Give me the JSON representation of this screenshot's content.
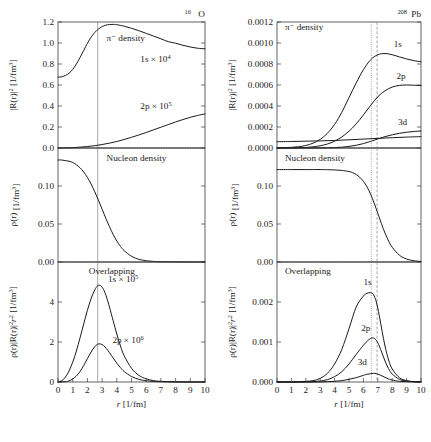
{
  "figure": {
    "caption_present": false,
    "x_axis": {
      "label": "r",
      "units": "[1/fm]",
      "min": 0,
      "max": 10,
      "ticks": [
        "0",
        "1",
        "2",
        "3",
        "4",
        "5",
        "6",
        "7",
        "8",
        "9",
        "10"
      ]
    }
  },
  "panels": {
    "left": {
      "title_main": "O",
      "title_sup": "16",
      "top": {
        "ylabel_main": "|R(r)|",
        "ylabel_sup": "2",
        "ylabel_units": "[1/fm",
        "ylabel_units_sup": "3",
        "ylabel_units_end": "]",
        "yticks": [
          "1.2",
          "1.0",
          "0.8",
          "0.6",
          "0.4",
          "0.2",
          "0.0"
        ],
        "ymin": 0.0,
        "ymax": 1.2,
        "annotation_density": "π⁻  density",
        "annotation_1s": "1s × 10",
        "annotation_1s_sup": "4",
        "annotation_2p": "2p × 10",
        "annotation_2p_sup": "5"
      },
      "middle": {
        "ylabel_main": "ρ(r)",
        "ylabel_units": "[1/fm",
        "ylabel_units_sup": "3",
        "ylabel_units_end": "]",
        "yticks": [
          "0.15",
          "0.10",
          "0.05",
          "0.00"
        ],
        "ymin": 0.0,
        "ymax": 0.19,
        "annotation": "Nucleon density"
      },
      "bottom": {
        "ylabel_main": "ρ(r)|R(r)|",
        "ylabel_sup": "2",
        "ylabel_r2": "r",
        "ylabel_r2_sup": "2",
        "ylabel_units": "[1/fm",
        "ylabel_units_sup": "3",
        "ylabel_units_end": "]",
        "yticks": [
          "6",
          "4",
          "2",
          "0"
        ],
        "ymin": 0.0,
        "ymax": 7.2,
        "annotation_overlap": "Overlapping",
        "annotation_1s": "1s × 10",
        "annotation_1s_sup": "5",
        "annotation_2p": "2p × 10",
        "annotation_2p_sup": "6"
      }
    },
    "right": {
      "title_main": "Pb",
      "title_sup": "208",
      "top": {
        "ylabel_main": "|R(r)|",
        "ylabel_sup": "2",
        "ylabel_units": "[1/fm",
        "ylabel_units_sup": "3",
        "ylabel_units_end": "]",
        "yticks": [
          "0.0012",
          "0.0010",
          "0.0008",
          "0.0006",
          "0.0004",
          "0.0002",
          "0.0000"
        ],
        "ymin": 0.0,
        "ymax": 0.0012,
        "annotation_density": "π⁻  density",
        "label_1s": "1s",
        "label_2p": "2p",
        "label_3d": "3d"
      },
      "middle": {
        "ylabel_main": "ρ(r)",
        "ylabel_units": "[1/fm",
        "ylabel_units_sup": "3",
        "ylabel_units_end": "]",
        "yticks": [
          "0.15",
          "0.10",
          "0.05",
          "0.00"
        ],
        "ymin": 0.0,
        "ymax": 0.185,
        "annotation": "Nucleon density"
      },
      "bottom": {
        "ylabel_main": "ρ(r)|R(r)|",
        "ylabel_sup": "2",
        "ylabel_r2": "r",
        "ylabel_r2_sup": "2",
        "ylabel_units": "[1/fm",
        "ylabel_units_sup": "3",
        "ylabel_units_end": "]",
        "yticks": [
          "0.003",
          "0.002",
          "0.001",
          "0.000"
        ],
        "ymin": 0.0,
        "ymax": 0.0036,
        "annotation_overlap": "Overlapping",
        "label_1s": "1s",
        "label_2p": "2p",
        "label_3d": "3d"
      }
    }
  },
  "chart_data": [
    {
      "id": "left-top",
      "type": "line",
      "title": "16O pi- density",
      "xlabel": "r [1/fm]",
      "ylabel": "|R(r)|^2 [1/fm^3]",
      "xlim": [
        0,
        10
      ],
      "ylim": [
        0.0,
        1.2
      ],
      "grid": false,
      "legend": "inline annotations",
      "vertical_reference_lines": [
        2.7
      ],
      "series": [
        {
          "name": "1s x 10^4",
          "x": [
            0,
            0.25,
            0.5,
            0.75,
            1.0,
            1.25,
            1.5,
            1.75,
            2.0,
            2.25,
            2.5,
            2.75,
            3.0,
            3.25,
            3.5,
            3.75,
            4.0,
            4.5,
            5.0,
            5.5,
            6.0,
            6.5,
            7.0,
            7.5,
            8.0,
            8.5,
            9.0,
            9.5,
            10.0
          ],
          "y": [
            0.675,
            0.678,
            0.69,
            0.712,
            0.748,
            0.8,
            0.862,
            0.93,
            0.997,
            1.055,
            1.1,
            1.133,
            1.156,
            1.17,
            1.176,
            1.177,
            1.174,
            1.16,
            1.14,
            1.117,
            1.092,
            1.066,
            1.04,
            1.013,
            0.998,
            0.978,
            0.962,
            0.95,
            0.945
          ]
        },
        {
          "name": "2p x 10^5",
          "x": [
            0,
            0.5,
            1.0,
            1.5,
            2.0,
            2.5,
            3.0,
            3.5,
            4.0,
            4.5,
            5.0,
            5.5,
            6.0,
            6.5,
            7.0,
            7.5,
            8.0,
            8.5,
            9.0,
            9.5,
            10.0
          ],
          "y": [
            0.0,
            0.001,
            0.003,
            0.008,
            0.014,
            0.022,
            0.033,
            0.046,
            0.062,
            0.081,
            0.102,
            0.124,
            0.148,
            0.173,
            0.198,
            0.223,
            0.248,
            0.271,
            0.292,
            0.31,
            0.325
          ]
        }
      ]
    },
    {
      "id": "left-middle",
      "type": "line",
      "title": "16O Nucleon density",
      "xlabel": "r [1/fm]",
      "ylabel": "rho(r) [1/fm^3]",
      "xlim": [
        0,
        10
      ],
      "ylim": [
        0.0,
        0.19
      ],
      "grid": false,
      "vertical_reference_lines": [
        2.7
      ],
      "series": [
        {
          "name": "nucleon density",
          "x": [
            0,
            0.25,
            0.5,
            0.75,
            1.0,
            1.25,
            1.5,
            1.75,
            2.0,
            2.25,
            2.5,
            2.75,
            3.0,
            3.25,
            3.5,
            3.75,
            4.0,
            4.25,
            4.5,
            5.0,
            5.5,
            6.0,
            6.5,
            7.0,
            8.0,
            9.0,
            10.0
          ],
          "y": [
            0.17,
            0.17,
            0.169,
            0.168,
            0.166,
            0.162,
            0.157,
            0.15,
            0.141,
            0.13,
            0.117,
            0.103,
            0.088,
            0.073,
            0.059,
            0.046,
            0.035,
            0.026,
            0.019,
            0.0095,
            0.0045,
            0.0021,
            0.001,
            0.0005,
            0.0001,
            3e-05,
            1e-05
          ]
        }
      ]
    },
    {
      "id": "left-bottom",
      "type": "line",
      "title": "16O Overlapping",
      "xlabel": "r [1/fm]",
      "ylabel": "rho(r)|R(r)|^2 r^2 [1/fm^3]",
      "xlim": [
        0,
        10
      ],
      "ylim": [
        0.0,
        7.2
      ],
      "grid": false,
      "vertical_reference_lines": [
        2.7
      ],
      "series": [
        {
          "name": "1s x 10^5",
          "x": [
            0,
            0.25,
            0.5,
            0.75,
            1.0,
            1.25,
            1.5,
            1.75,
            2.0,
            2.25,
            2.5,
            2.7,
            2.9,
            3.1,
            3.3,
            3.5,
            3.75,
            4.0,
            4.25,
            4.5,
            5.0,
            5.5,
            6.0,
            6.5,
            7.0,
            8.0,
            9.0,
            10.0
          ],
          "y": [
            0.0,
            0.07,
            0.29,
            0.66,
            1.19,
            1.86,
            2.65,
            3.49,
            4.3,
            5.0,
            5.52,
            5.78,
            5.78,
            5.55,
            5.1,
            4.5,
            3.68,
            2.88,
            2.16,
            1.58,
            0.82,
            0.4,
            0.19,
            0.085,
            0.04,
            0.008,
            0.002,
            0.0
          ]
        },
        {
          "name": "2p x 10^6",
          "x": [
            0,
            0.5,
            0.75,
            1.0,
            1.25,
            1.5,
            1.75,
            2.0,
            2.25,
            2.5,
            2.7,
            2.9,
            3.1,
            3.3,
            3.5,
            3.75,
            4.0,
            4.25,
            4.5,
            5.0,
            5.5,
            6.0,
            6.5,
            7.0,
            8.0,
            9.0,
            10.0
          ],
          "y": [
            0.0,
            0.02,
            0.07,
            0.18,
            0.36,
            0.63,
            0.99,
            1.4,
            1.8,
            2.12,
            2.27,
            2.28,
            2.19,
            2.0,
            1.76,
            1.44,
            1.13,
            0.86,
            0.63,
            0.33,
            0.16,
            0.075,
            0.035,
            0.016,
            0.003,
            0.001,
            0.0
          ]
        }
      ]
    },
    {
      "id": "right-top",
      "type": "line",
      "title": "208Pb pi- density",
      "xlabel": "r [1/fm]",
      "ylabel": "|R(r)|^2 [1/fm^3]",
      "xlim": [
        0,
        10
      ],
      "ylim": [
        0.0,
        0.0012
      ],
      "grid": false,
      "vertical_reference_lines": [
        6.55,
        6.95
      ],
      "series": [
        {
          "name": "1s",
          "x": [
            0,
            0.5,
            1.0,
            1.5,
            2.0,
            2.5,
            3.0,
            3.5,
            4.0,
            4.5,
            5.0,
            5.5,
            6.0,
            6.5,
            7.0,
            7.5,
            8.0,
            8.5,
            9.0,
            9.5,
            10.0
          ],
          "y": [
            2e-06,
            3e-06,
            6e-06,
            1.2e-05,
            2.4e-05,
            4.6e-05,
            8.2e-05,
            0.00014,
            0.000225,
            0.00034,
            0.00048,
            0.00062,
            0.000745,
            0.00084,
            0.000888,
            0.0009,
            0.000888,
            0.000868,
            0.000848,
            0.000832,
            0.000822
          ]
        },
        {
          "name": "2p",
          "x": [
            0,
            0.5,
            1.0,
            1.5,
            2.0,
            2.5,
            3.0,
            3.5,
            4.0,
            4.5,
            5.0,
            5.5,
            6.0,
            6.5,
            7.0,
            7.5,
            8.0,
            8.5,
            9.0,
            9.5,
            10.0
          ],
          "y": [
            0.0,
            0.0,
            1e-06,
            2e-06,
            5e-06,
            1.1e-05,
            2.1e-05,
            3.8e-05,
            6.5e-05,
            0.000105,
            0.00016,
            0.00023,
            0.000315,
            0.000405,
            0.000488,
            0.000545,
            0.00058,
            0.000596,
            0.0006,
            0.000598,
            0.000594
          ]
        },
        {
          "name": "3d",
          "x": [
            0,
            0.5,
            1.0,
            1.5,
            2.0,
            2.5,
            3.0,
            3.5,
            4.0,
            4.5,
            5.0,
            5.5,
            6.0,
            6.5,
            7.0,
            7.5,
            8.0,
            8.5,
            9.0,
            9.5,
            10.0
          ],
          "y": [
            0.0,
            0.0,
            0.0,
            0.0,
            0.0,
            0.0,
            1e-06,
            2e-06,
            4e-06,
            8e-06,
            1.5e-05,
            2.6e-05,
            4.2e-05,
            6.3e-05,
            8.6e-05,
            0.000108,
            0.000126,
            0.00014,
            0.00015,
            0.000157,
            0.000162
          ]
        },
        {
          "name": "baseline-small",
          "x": [
            0,
            1.0,
            2.0,
            3.0,
            4.0,
            5.0,
            6.0,
            7.0,
            8.0,
            9.0,
            10.0
          ],
          "y": [
            6e-05,
            6.2e-05,
            6.5e-05,
            6.8e-05,
            7.2e-05,
            7.8e-05,
            8.5e-05,
            9.2e-05,
            9.8e-05,
            0.000104,
            0.000108
          ]
        }
      ]
    },
    {
      "id": "right-middle",
      "type": "line",
      "title": "208Pb Nucleon density",
      "xlabel": "r [1/fm]",
      "ylabel": "rho(r) [1/fm^3]",
      "xlim": [
        0,
        10
      ],
      "ylim": [
        0.0,
        0.185
      ],
      "grid": false,
      "vertical_reference_lines": [
        6.55,
        6.95
      ],
      "series": [
        {
          "name": "nucleon density",
          "x": [
            0,
            1.0,
            2.0,
            3.0,
            3.5,
            4.0,
            4.5,
            5.0,
            5.25,
            5.5,
            5.75,
            6.0,
            6.25,
            6.5,
            6.75,
            7.0,
            7.25,
            7.5,
            7.75,
            8.0,
            8.5,
            9.0,
            9.5,
            10.0
          ],
          "y": [
            0.15,
            0.15,
            0.15,
            0.15,
            0.1498,
            0.1494,
            0.1486,
            0.1468,
            0.145,
            0.142,
            0.1375,
            0.131,
            0.122,
            0.11,
            0.0955,
            0.079,
            0.0625,
            0.047,
            0.034,
            0.024,
            0.011,
            0.0048,
            0.0021,
            0.0009
          ]
        }
      ]
    },
    {
      "id": "right-bottom",
      "type": "line",
      "title": "208Pb Overlapping",
      "xlabel": "r [1/fm]",
      "ylabel": "rho(r)|R(r)|^2 r^2 [1/fm^3]",
      "xlim": [
        0,
        10
      ],
      "ylim": [
        0.0,
        0.0036
      ],
      "grid": false,
      "vertical_reference_lines": [
        6.55,
        6.95
      ],
      "series": [
        {
          "name": "1s",
          "x": [
            0,
            0.5,
            1.0,
            1.5,
            2.0,
            2.5,
            3.0,
            3.5,
            4.0,
            4.5,
            5.0,
            5.5,
            6.0,
            6.25,
            6.5,
            6.7,
            6.9,
            7.1,
            7.3,
            7.5,
            7.75,
            8.0,
            8.5,
            9.0,
            9.5,
            10.0
          ],
          "y": [
            0.0,
            0.0,
            0.0,
            1e-05,
            2e-05,
            4e-05,
            0.00011,
            0.00026,
            0.00054,
            0.00098,
            0.0016,
            0.00225,
            0.00258,
            0.00266,
            0.00268,
            0.00262,
            0.0024,
            0.002,
            0.00152,
            0.00108,
            0.00066,
            0.00039,
            0.00013,
            4e-05,
            1e-05,
            3e-06
          ]
        },
        {
          "name": "2p",
          "x": [
            0,
            0.5,
            1.0,
            1.5,
            2.0,
            2.5,
            3.0,
            3.5,
            4.0,
            4.5,
            5.0,
            5.5,
            6.0,
            6.25,
            6.5,
            6.7,
            6.9,
            7.1,
            7.3,
            7.5,
            7.75,
            8.0,
            8.5,
            9.0,
            9.5,
            10.0
          ],
          "y": [
            0.0,
            0.0,
            0.0,
            0.0,
            0.0,
            1e-05,
            3e-05,
            7e-05,
            0.00016,
            0.00031,
            0.00054,
            0.00083,
            0.0011,
            0.00122,
            0.00131,
            0.00132,
            0.00125,
            0.00108,
            0.00086,
            0.00063,
            0.0004,
            0.00024,
            8e-05,
            3e-05,
            1e-05,
            2e-06
          ]
        },
        {
          "name": "3d",
          "x": [
            0,
            0.5,
            1.0,
            1.5,
            2.0,
            2.5,
            3.0,
            3.5,
            4.0,
            4.5,
            5.0,
            5.5,
            6.0,
            6.25,
            6.5,
            6.7,
            6.9,
            7.1,
            7.3,
            7.5,
            7.75,
            8.0,
            8.5,
            9.0,
            9.5,
            10.0
          ],
          "y": [
            0.0,
            0.0,
            0.0,
            0.0,
            0.0,
            0.0,
            0.0,
            1e-05,
            2e-05,
            4e-05,
            8e-05,
            0.00013,
            0.0002,
            0.00023,
            0.00025,
            0.00026,
            0.00025,
            0.00022,
            0.00018,
            0.00014,
            9e-05,
            6e-05,
            2e-05,
            1e-05,
            3e-06,
            1e-06
          ]
        }
      ]
    }
  ]
}
